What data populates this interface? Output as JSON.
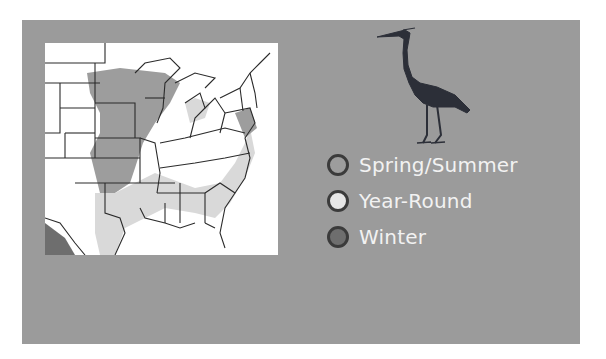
{
  "figure": {
    "type": "range-map",
    "subject_icon": "heron-silhouette-icon",
    "colors": {
      "panel_background": "#9b9b9b",
      "map_background": "#ffffff",
      "state_outline": "#2b2b2b",
      "heron": "#2c2f38",
      "legend_text": "#f2f2f2"
    }
  },
  "legend": {
    "items": [
      {
        "label": "Spring/Summer",
        "color": "#9d9d9d"
      },
      {
        "label": "Year-Round",
        "color": "#e6e6e6"
      },
      {
        "label": "Winter",
        "color": "#6e6e6e"
      }
    ]
  },
  "map": {
    "region": "Eastern United States",
    "zones": [
      {
        "season": "Spring/Summer",
        "areas": [
          "Upper Midwest",
          "Great Plains east",
          "Central states"
        ]
      },
      {
        "season": "Year-Round",
        "areas": [
          "Southeast",
          "Gulf Coast",
          "Mid-Atlantic coast",
          "Great Lakes shores"
        ]
      },
      {
        "season": "Winter",
        "areas": [
          "South Texas / Mexico border"
        ]
      }
    ]
  }
}
